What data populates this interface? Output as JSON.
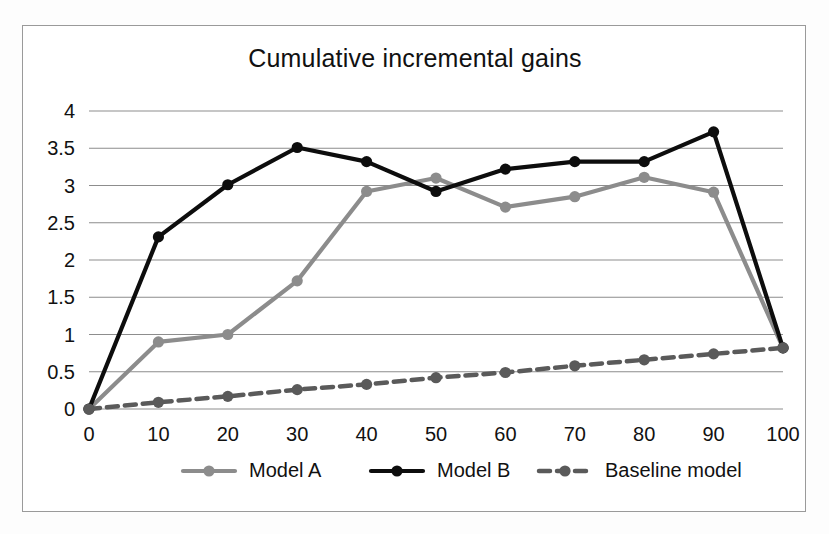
{
  "figure": {
    "background_color": "#fdfdfd",
    "frame_color": "#9a9a9a",
    "plot_background": "#ffffff"
  },
  "chart_data": {
    "type": "line",
    "title": "Cumulative incremental gains",
    "xlabel": "",
    "ylabel": "",
    "x": [
      0,
      10,
      20,
      30,
      40,
      50,
      60,
      70,
      80,
      90,
      100
    ],
    "categories": [
      "0",
      "10",
      "20",
      "30",
      "40",
      "50",
      "60",
      "70",
      "80",
      "90",
      "100"
    ],
    "xlim": [
      0,
      100
    ],
    "ylim": [
      0,
      4
    ],
    "xticks": [
      "0",
      "10",
      "20",
      "30",
      "40",
      "50",
      "60",
      "70",
      "80",
      "90",
      "100"
    ],
    "yticks": [
      "0",
      "0.5",
      "1",
      "1.5",
      "2",
      "2.5",
      "3",
      "3.5",
      "4"
    ],
    "ytick_values": [
      0,
      0.5,
      1,
      1.5,
      2,
      2.5,
      3,
      3.5,
      4
    ],
    "grid": "horizontal",
    "legend_position": "bottom",
    "series": [
      {
        "name": "Model A",
        "color": "#8c8c8c",
        "style": "solid",
        "marker": "circle",
        "values": [
          0,
          0.9,
          1.0,
          1.72,
          2.92,
          3.1,
          2.71,
          2.85,
          3.11,
          2.91,
          0.82
        ]
      },
      {
        "name": "Model B",
        "color": "#0d0d0d",
        "style": "solid",
        "marker": "circle",
        "values": [
          0,
          2.31,
          3.01,
          3.51,
          3.32,
          2.92,
          3.22,
          3.32,
          3.32,
          3.72,
          0.82
        ]
      },
      {
        "name": "Baseline model",
        "color": "#5a5a5a",
        "style": "dashed",
        "marker": "circle",
        "values": [
          0,
          0.09,
          0.17,
          0.26,
          0.33,
          0.42,
          0.49,
          0.58,
          0.66,
          0.74,
          0.82
        ]
      }
    ]
  },
  "legend": {
    "entries": [
      {
        "label": "Model A"
      },
      {
        "label": "Model B"
      },
      {
        "label": "Baseline model"
      }
    ]
  }
}
